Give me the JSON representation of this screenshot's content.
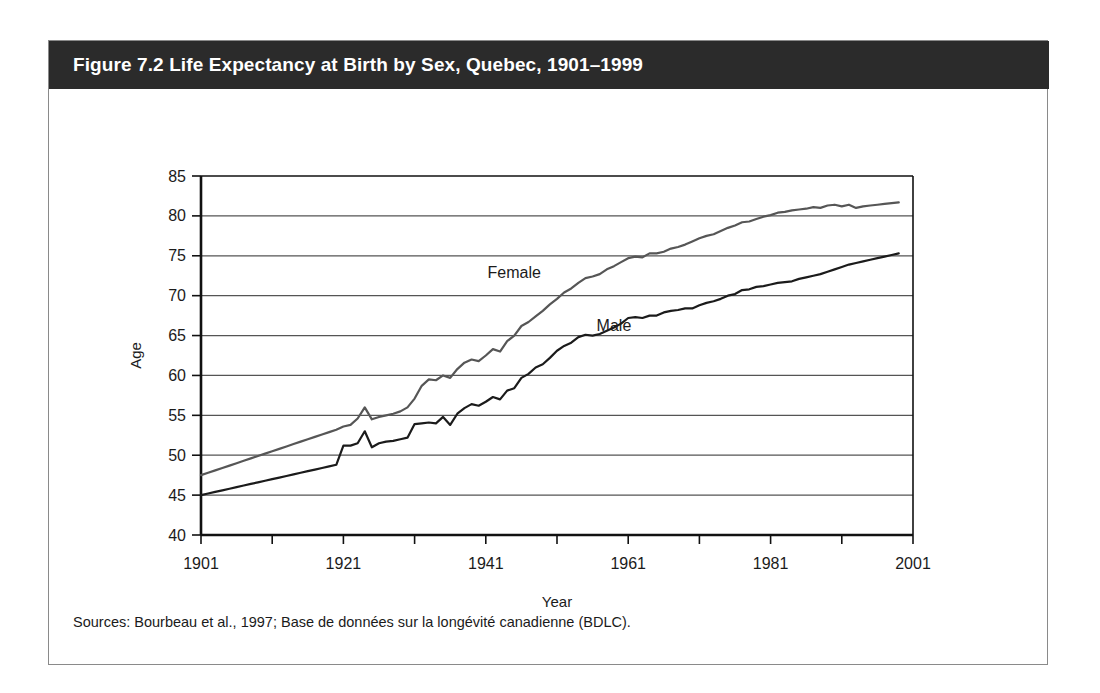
{
  "figure": {
    "title": "Figure 7.2 Life Expectancy at Birth by Sex, Quebec, 1901–1999",
    "sources": "Sources: Bourbeau et al., 1997; Base de données sur la longévité canadienne (BDLC).",
    "header_background": "#2b2b2b",
    "header_text_color": "#ffffff",
    "border_color": "#8a8a8a"
  },
  "chart_data": {
    "type": "line",
    "title": "Life Expectancy at Birth by Sex, Quebec, 1901–1999",
    "xlabel": "Year",
    "ylabel": "Age",
    "xlim": [
      1901,
      2001
    ],
    "ylim": [
      40,
      85
    ],
    "xticks": [
      1901,
      1921,
      1941,
      1961,
      1981,
      2001
    ],
    "xtick_labels": [
      "1901",
      "1921",
      "1941",
      "1961",
      "1981",
      "2001"
    ],
    "xminor_step": 10,
    "yticks": [
      40,
      45,
      50,
      55,
      60,
      65,
      70,
      75,
      80,
      85
    ],
    "ytick_labels": [
      "40",
      "45",
      "50",
      "55",
      "60",
      "65",
      "70",
      "75",
      "80",
      "85"
    ],
    "grid": "horizontal",
    "legend": "inline-annotations",
    "annotations": [
      {
        "text": "Female",
        "x": 1945,
        "y": 72.2,
        "color": "#4d4d4d"
      },
      {
        "text": "Male",
        "x": 1959,
        "y": 65.6,
        "color": "#1b1b1b"
      }
    ],
    "x": [
      1901,
      1902,
      1903,
      1904,
      1905,
      1906,
      1907,
      1908,
      1909,
      1910,
      1911,
      1912,
      1913,
      1914,
      1915,
      1916,
      1917,
      1918,
      1919,
      1920,
      1921,
      1922,
      1923,
      1924,
      1925,
      1926,
      1927,
      1928,
      1929,
      1930,
      1931,
      1932,
      1933,
      1934,
      1935,
      1936,
      1937,
      1938,
      1939,
      1940,
      1941,
      1942,
      1943,
      1944,
      1945,
      1946,
      1947,
      1948,
      1949,
      1950,
      1951,
      1952,
      1953,
      1954,
      1955,
      1956,
      1957,
      1958,
      1959,
      1960,
      1961,
      1962,
      1963,
      1964,
      1965,
      1966,
      1967,
      1968,
      1969,
      1970,
      1971,
      1972,
      1973,
      1974,
      1975,
      1976,
      1977,
      1978,
      1979,
      1980,
      1981,
      1982,
      1983,
      1984,
      1985,
      1986,
      1987,
      1988,
      1989,
      1990,
      1991,
      1992,
      1993,
      1994,
      1995,
      1996,
      1997,
      1998,
      1999
    ],
    "series": [
      {
        "name": "Female",
        "color": "#565656",
        "values": [
          47.5,
          47.8,
          48.1,
          48.4,
          48.7,
          49.0,
          49.3,
          49.6,
          49.9,
          50.2,
          50.5,
          50.8,
          51.1,
          51.4,
          51.7,
          52.0,
          52.3,
          52.6,
          52.9,
          53.2,
          53.6,
          53.8,
          54.6,
          56.0,
          54.5,
          54.8,
          55.0,
          55.2,
          55.5,
          56.0,
          57.1,
          58.7,
          59.5,
          59.4,
          60.0,
          59.7,
          60.8,
          61.6,
          62.0,
          61.8,
          62.5,
          63.3,
          63.0,
          64.3,
          65.0,
          66.2,
          66.7,
          67.4,
          68.1,
          68.9,
          69.6,
          70.4,
          70.9,
          71.6,
          72.2,
          72.4,
          72.7,
          73.3,
          73.7,
          74.2,
          74.7,
          74.9,
          74.8,
          75.3,
          75.3,
          75.5,
          75.9,
          76.1,
          76.4,
          76.8,
          77.2,
          77.5,
          77.7,
          78.1,
          78.5,
          78.8,
          79.2,
          79.3,
          79.6,
          79.9,
          80.1,
          80.4,
          80.5,
          80.7,
          80.8,
          80.9,
          81.1,
          81.0,
          81.3,
          81.4,
          81.2,
          81.4,
          81.0,
          81.2,
          81.3,
          81.4,
          81.5,
          81.6,
          81.7
        ]
      },
      {
        "name": "Male",
        "color": "#1b1b1b",
        "values": [
          45.0,
          45.2,
          45.4,
          45.6,
          45.8,
          46.0,
          46.2,
          46.4,
          46.6,
          46.8,
          47.0,
          47.2,
          47.4,
          47.6,
          47.8,
          48.0,
          48.2,
          48.4,
          48.6,
          48.8,
          51.2,
          51.2,
          51.5,
          53.0,
          51.0,
          51.5,
          51.7,
          51.8,
          52.0,
          52.2,
          53.9,
          54.0,
          54.1,
          54.0,
          54.8,
          53.8,
          55.2,
          55.9,
          56.4,
          56.2,
          56.7,
          57.3,
          57.0,
          58.1,
          58.4,
          59.7,
          60.2,
          61.0,
          61.4,
          62.2,
          63.1,
          63.7,
          64.1,
          64.8,
          65.1,
          65.0,
          65.2,
          65.6,
          66.0,
          66.5,
          67.2,
          67.3,
          67.2,
          67.5,
          67.5,
          67.9,
          68.1,
          68.2,
          68.4,
          68.4,
          68.8,
          69.1,
          69.3,
          69.6,
          70.0,
          70.2,
          70.7,
          70.8,
          71.1,
          71.2,
          71.4,
          71.6,
          71.7,
          71.8,
          72.1,
          72.3,
          72.5,
          72.7,
          73.0,
          73.3,
          73.6,
          73.9,
          74.1,
          74.3,
          74.5,
          74.7,
          74.9,
          75.1,
          75.3
        ]
      }
    ]
  }
}
